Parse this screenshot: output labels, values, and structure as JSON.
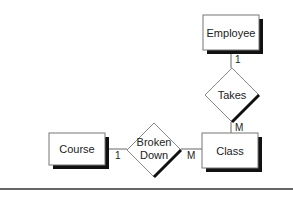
{
  "diagram": {
    "type": "entity-relationship",
    "entities": [
      {
        "id": "employee",
        "label": "Employee"
      },
      {
        "id": "class",
        "label": "Class"
      },
      {
        "id": "course",
        "label": "Course"
      }
    ],
    "relationships": [
      {
        "id": "takes",
        "label": "Takes"
      },
      {
        "id": "broken_down",
        "label_line1": "Broken",
        "label_line2": "Down"
      }
    ],
    "cardinalities": {
      "employee_takes": "1",
      "takes_class": "M",
      "course_broken_down": "1",
      "broken_down_class": "M"
    },
    "colors": {
      "stroke": "#555555",
      "shadow": "#111111",
      "fill": "#ffffff",
      "text": "#222222"
    }
  }
}
